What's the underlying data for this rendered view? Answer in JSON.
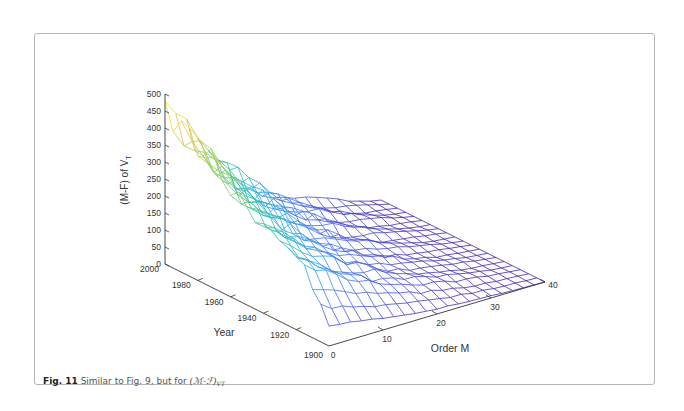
{
  "figure": {
    "caption_label": "Fig. 11",
    "caption_text": " Similar to Fig. 9, but for ",
    "caption_math": "(ℳ-ℱ)",
    "caption_math_subscript": "VT"
  },
  "chart_data": {
    "type": "surface-mesh",
    "title": "",
    "zlabel": "(M-F) of V",
    "zlabel_subscript": "T",
    "xlabel": "Order M",
    "ylabel": "Year",
    "x_ticks": [
      "0",
      "10",
      "20",
      "30",
      "40"
    ],
    "y_ticks": [
      "1900",
      "1920",
      "1940",
      "1960",
      "1980",
      "2000"
    ],
    "z_ticks": [
      "0",
      "50",
      "100",
      "150",
      "200",
      "250",
      "300",
      "350",
      "400",
      "450",
      "500"
    ],
    "xlim": [
      0,
      40
    ],
    "ylim": [
      1900,
      2000
    ],
    "zlim": [
      0,
      500
    ],
    "grid": false,
    "colormap": "parula",
    "colormap_stops": [
      "#3e26a8",
      "#4a5ee8",
      "#2f9df4",
      "#23c1aa",
      "#8cd34f",
      "#e7c23d",
      "#f9fb0e"
    ],
    "order_m_grid": [
      0,
      2,
      4,
      6,
      8,
      10,
      12,
      14,
      16,
      18,
      20,
      22,
      24,
      26,
      28,
      30,
      32,
      34,
      36,
      38,
      40
    ],
    "year_grid": [
      1900,
      1910,
      1920,
      1930,
      1940,
      1950,
      1960,
      1970,
      1980,
      1990,
      2000
    ],
    "peak_values_at_low_order": [
      {
        "year": 2000,
        "order_m": 0,
        "value": 360
      },
      {
        "year": 1990,
        "order_m": 2,
        "value": 430
      },
      {
        "year": 1980,
        "order_m": 2,
        "value": 430
      },
      {
        "year": 1970,
        "order_m": 2,
        "value": 500
      },
      {
        "year": 1960,
        "order_m": 2,
        "value": 460
      },
      {
        "year": 1950,
        "order_m": 2,
        "value": 500
      }
    ]
  }
}
